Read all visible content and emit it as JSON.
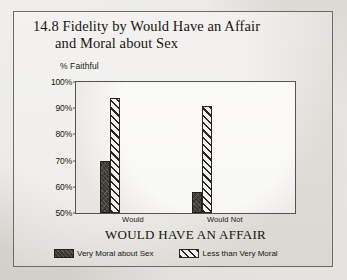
{
  "figure": {
    "title_line1": "14.8 Fidelity by Would Have an Affair",
    "title_line2": "and Moral about Sex"
  },
  "chart_data": {
    "type": "bar",
    "title": "14.8 Fidelity by Would Have an Affair and Moral about Sex",
    "xlabel": "WOULD HAVE AN AFFAIR",
    "ylabel": "% Faithful",
    "categories": [
      "Would",
      "Would Not"
    ],
    "series": [
      {
        "name": "Very Moral about Sex",
        "values": [
          70,
          58
        ],
        "style": "solid",
        "color": "#3a352f"
      },
      {
        "name": "Less than Very Moral",
        "values": [
          94,
          91
        ],
        "style": "hatch",
        "color": "#2a2722"
      }
    ],
    "ylim": [
      50,
      100
    ],
    "yticks": [
      "50%",
      "60%",
      "70%",
      "80%",
      "90%",
      "100%"
    ],
    "ytick_values": [
      50,
      60,
      70,
      80,
      90,
      100
    ],
    "grid": false,
    "legend_position": "bottom"
  },
  "note": "Within each category the first bar is Very Moral about Sex, the second is Less than Very Moral. Would: 70 vs 58. Would Not: 94 vs 91."
}
